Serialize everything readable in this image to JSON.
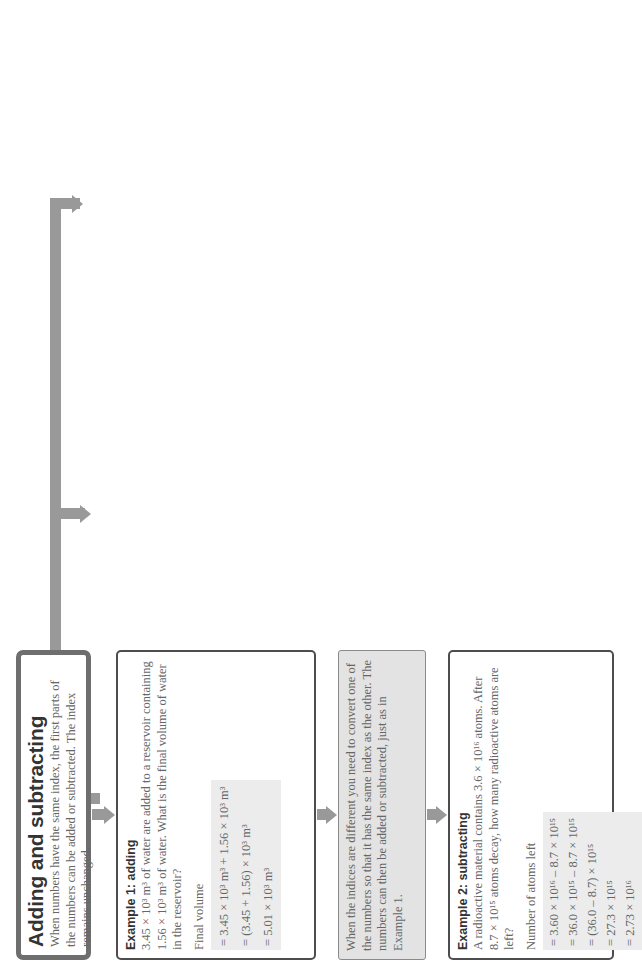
{
  "adding": {
    "title": "Adding and subtracting",
    "intro": "When numbers have the same index, the first parts of the numbers can be added or subtracted. The index remains unchanged.",
    "example1": {
      "title": "Example 1: adding",
      "question": "3.45 × 10³ m³ of water are added to a reservoir containing 1.56 × 10³ m³ of water. What is the final volume of water in the reservoir?",
      "label": "Final volume",
      "steps": [
        "= 3.45 × 10³ m³ + 1.56 × 10³ m³",
        "= (3.45 + 1.56) × 10³ m³",
        "= 5.01 × 10³ m³"
      ]
    },
    "note": "When the indices are different you need to convert one of the numbers so that it has the same index as the other. The numbers can then be added or subtracted, just as in Example 1.",
    "example2": {
      "title": "Example 2: subtracting",
      "question": "A radioactive material contains 3.6 × 10¹⁶ atoms. After 8.7 × 10¹⁵ atoms decay, how many radioactive atoms are left?",
      "label": "Number of atoms left",
      "steps": [
        "= 3.60 × 10¹⁶ – 8.7 × 10¹⁵",
        "= 36.0 × 10¹⁵ – 8.7 × 10¹⁵",
        "= (36.0 – 8.7) × 10¹⁵",
        "= 27.3 × 10¹⁵",
        "= 2.73 × 10¹⁶"
      ]
    }
  },
  "multiplying": {
    "title": "Multiplying and dividing",
    "intro": "To multiply or divide, the two parts of the number are treated separately. Multiply or divide the number parts and then the parts that contain indices.",
    "example1": {
      "title": "Example 1: multiplying",
      "question": "The current in a wire of resistance 1.5 × 10⁶ Ω is 1.8 × 10⁻³ A. Calculate the potential difference across the wire.",
      "label": "Potential difference",
      "steps": [
        "= current × resistance",
        "= 1.8 × 10⁻³ × 1.5 × 10⁶",
        "= (1.8 × 1.5) × (10⁻³ × 10⁶)",
        "= 2.7 × 10³ V"
      ]
    },
    "example2": {
      "title": "Example 2: dividing",
      "question": "4.0 × 10⁻² kg of helium contains 6.0 × 10²³ atoms. How many atoms are there in 1.0 kg of helium?",
      "label": "Number of atoms in 1.0 kg",
      "frac1": {
        "num": "6.0 × 10²³",
        "den": "4.0 × 10⁻³"
      },
      "frac2a": {
        "num": "6.0",
        "den": "4.0"
      },
      "frac2b": {
        "num": "10²³",
        "den": "10⁻³"
      },
      "result": "= 1.5 × 10²⁶"
    }
  },
  "squaring": {
    "title": "Squaring or cubing",
    "text": "This is often necessary when finding areas or volumes. In this case, square or cube each part of the number independently.",
    "bold": "Remember to square or cube the unit also.",
    "example1": {
      "title": "Example 1",
      "steps": [
        "(4.0 × 10³ s)² = 4.0² × (10³)² s²",
        "= 16 × 10⁶ s²",
        "= 1.6 × 10⁷ s²"
      ]
    },
    "example2": {
      "title": "Example 2",
      "steps": [
        "(3.0 × 10⁻¹⁰ m)³ = 3.0³ × (10⁻¹⁰)³ m³",
        "= 27 × 10⁻³⁰ m³",
        "= 2.7 × 10⁻²⁹ m³"
      ]
    }
  },
  "roots": {
    "title": "Finding square roots",
    "text": "You may need to rewrite the number in a form that has an even index. Then determine the square root of the number part and the index (which is halved because square root is the same as raising to the index ½).",
    "example1": {
      "title": "Example 1",
      "steps": [
        "√(25 × 10²⁰) = √(25) × √(10²⁰)",
        "= 5 × 10¹⁰"
      ]
    },
    "example2": {
      "title": "Example 2",
      "steps": [
        "√(3.6 × 10¹¹) = √(36 × 10¹⁰)",
        "= √(36) × √(10¹⁰) = 6 × 10⁵"
      ]
    }
  },
  "questions": {
    "title": "Questions to try",
    "subtitle": "Calculate:",
    "items": [
      "1. 5.4 × 10³ m – 7.6 × 10² m",
      "2. 3.4 × 10⁻²⁷ kg + 5.1 × 10⁻²⁷ kg",
      "3. (a) √(9.0 × 10¹⁶)",
      "    (b) √(1.6 × 10⁷)",
      "    (c) (2.2 × 10¹⁹)⁰·⁵",
      "4. π (1.7 × 10⁶)² m² (the surface area of",
      "    the Moon)",
      "5.",
      "    (the gravitational force between the Earth",
      "    and the Moon)",
      "6. ⁴⁄₃ π (1.6 × 10⁻¹⁰)³ m³ (the volume of",
      "    an atom)"
    ],
    "q5_num": "6.7 × 10⁻¹¹ × 6.4 × 10²⁴ × 7.4 × 10²²",
    "q5_den": "(3.8 × 10⁸)²",
    "q5_unit": "N"
  },
  "more": {
    "title": "If you want to know more about:",
    "rows": [
      {
        "topic": "Indices",
        "ref": "see pages 8–9"
      },
      {
        "topic": "Standard form",
        "ref": "see page 10"
      },
      {
        "topic": "Approximate calculations",
        "ref": ""
      },
      {
        "topic": "and estimates",
        "ref": "see page 15"
      }
    ],
    "icon": "pointing-hand-icon"
  }
}
